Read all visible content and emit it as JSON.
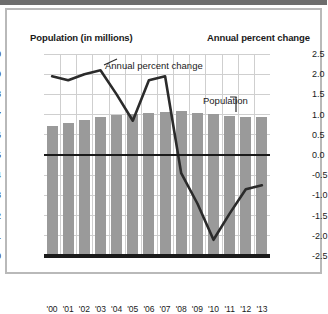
{
  "titles": {
    "left_axis_title": "Population (in millions)",
    "right_axis_title": "Annual percent change"
  },
  "annotations": {
    "line_label": "Annual percent change",
    "bar_label": "Population"
  },
  "colors": {
    "bar_fill": "#9a9a9a",
    "line_stroke": "#2b2b2b",
    "grid": "#cfcfcf",
    "axis": "#1a1a1a",
    "frame": "#b9b9b9",
    "top_rule": "#6d6d6d",
    "background": "#ffffff"
  },
  "chart_data": {
    "type": "bar",
    "title": "",
    "xlabel": "",
    "ylabel": "Population (in millions)",
    "y2label": "Annual percent change",
    "grid": true,
    "legend": "inline-annotations",
    "categories": [
      "'00",
      "'01",
      "'02",
      "'03",
      "'04",
      "'05",
      "'06",
      "'07",
      "'08",
      "'09",
      "'10",
      "'11",
      "'12",
      "'13"
    ],
    "ylim": [
      0,
      10
    ],
    "yticks": [
      "0",
      "1",
      "2",
      "3",
      "4",
      "5",
      "6",
      "7",
      "8",
      "9",
      "10"
    ],
    "y2lim": [
      -2.5,
      2.5
    ],
    "y2ticks": [
      "2.5",
      "2.0",
      "1.5",
      "1.0",
      "0.5",
      "0.0",
      "-0.5",
      "-1.0",
      "-1.5",
      "-2.0",
      "-2.5"
    ],
    "series": [
      {
        "name": "Population",
        "type": "bar",
        "axis": "left",
        "unit": "millions",
        "values": [
          6.45,
          6.6,
          6.75,
          6.9,
          7.0,
          7.05,
          7.1,
          7.15,
          7.2,
          7.1,
          7.05,
          6.95,
          6.9,
          6.9
        ]
      },
      {
        "name": "Annual percent change",
        "type": "line",
        "axis": "right",
        "unit": "percent",
        "values": [
          1.95,
          1.85,
          2.0,
          2.1,
          1.5,
          0.85,
          1.85,
          1.95,
          -0.45,
          -1.2,
          -2.1,
          -1.45,
          -0.85,
          -0.75
        ]
      }
    ]
  }
}
